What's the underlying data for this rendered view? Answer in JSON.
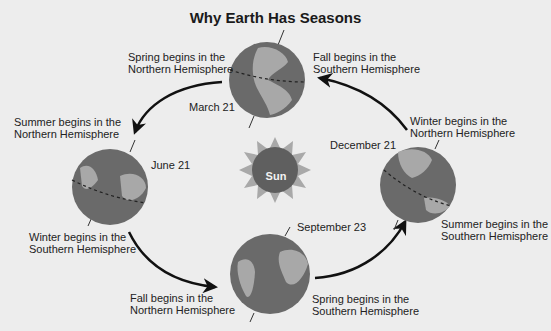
{
  "title": "Why Earth Has Seasons",
  "sun": {
    "label": "Sun"
  },
  "positions": [
    {
      "date": "March 21",
      "labels": [
        "Spring begins in the\nNorthern Hemisphere",
        "Fall begins in the\nSouthern Hemisphere"
      ]
    },
    {
      "date": "June 21",
      "labels": [
        "Summer begins in the\nNorthern Hemisphere",
        "Winter begins in the\nSouthern Hemisphere"
      ]
    },
    {
      "date": "September 23",
      "labels": [
        "Fall begins in the\nNorthern Hemisphere",
        "Spring begins in the\nSouthern Hemisphere"
      ]
    },
    {
      "date": "December 21",
      "labels": [
        "Winter begins in the\nNorthern Hemisphere",
        "Summer begins in the\nSouthern Hemisphere"
      ]
    }
  ],
  "text": {
    "mar_n1": "Spring begins in the",
    "mar_n2": "Northern Hemisphere",
    "mar_s1": "Fall begins in the",
    "mar_s2": "Southern Hemisphere",
    "jun_n1": "Summer begins in the",
    "jun_n2": "Northern Hemisphere",
    "jun_s1": "Winter begins in the",
    "jun_s2": "Southern Hemisphere",
    "sep_n1": "Fall begins in the",
    "sep_n2": "Northern Hemisphere",
    "sep_s1": "Spring begins in the",
    "sep_s2": "Southern Hemisphere",
    "dec_n1": "Winter begins in the",
    "dec_n2": "Northern Hemisphere",
    "dec_s1": "Summer begins in the",
    "dec_s2": "Southern Hemisphere"
  },
  "colors": {
    "ocean": "#6a6a6a",
    "land": "#a8a8a8",
    "sun_core": "#5f5f5f",
    "sun_rays": "#a9a9a9",
    "arrow": "#111111"
  }
}
